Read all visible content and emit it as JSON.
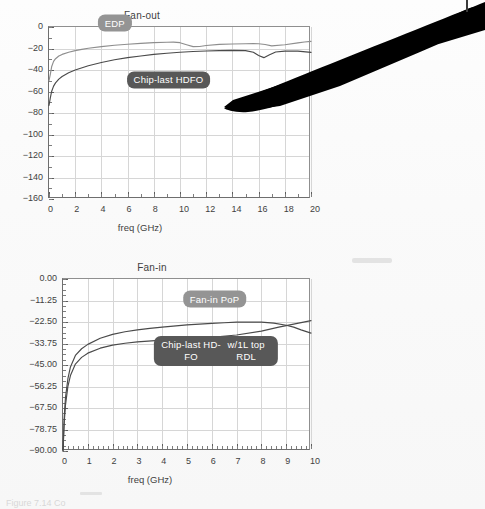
{
  "document": {
    "kind": "scanned-figure-page",
    "caption_partial": "Figure 7.14  Co",
    "background_color": "#fafafa"
  },
  "colors": {
    "axis": "#6e6e6e",
    "grid": "#d6d6d6",
    "text": "#3f3f3f",
    "curve_light": "#8e8e8e",
    "curve_dark": "#4a4a4a",
    "callout_light": "#949494",
    "callout_dark": "#585858",
    "artifact": "#000000"
  },
  "artifacts": {
    "black_wedge_name": "scan-shadow-wedge",
    "edge_mark_name": "page-edge-mark"
  },
  "chart_data": [
    {
      "type": "line",
      "name": "fan-out",
      "title": "Fan-out",
      "xlabel": "freq (GHz)",
      "ylabel": "",
      "xlim": [
        0,
        20
      ],
      "ylim": [
        -160,
        0
      ],
      "xticks": [
        0,
        2,
        4,
        6,
        8,
        10,
        12,
        14,
        16,
        18,
        20
      ],
      "xtick_labels": [
        "0",
        "2",
        "4",
        "6",
        "8",
        "10",
        "12",
        "14",
        "16",
        "18",
        "20"
      ],
      "x_minor_step": 1,
      "yticks": [
        0,
        -20,
        -40,
        -60,
        -80,
        -100,
        -120,
        -140,
        -160
      ],
      "ytick_labels": [
        "0",
        "-20",
        "-40",
        "-60",
        "-80",
        "-100",
        "-120",
        "-140",
        "-160"
      ],
      "y_minor_step": 10,
      "grid": true,
      "legend_position": "inline-callouts",
      "series": [
        {
          "name": "EDP",
          "color": "#8e8e8e",
          "x": [
            0,
            0.1,
            0.2,
            0.35,
            0.5,
            0.75,
            1,
            1.5,
            2,
            2.5,
            3,
            4,
            5,
            6,
            7,
            8,
            9,
            9.5,
            10,
            10.5,
            11,
            11.5,
            12,
            13,
            14,
            15,
            15.6,
            16,
            16.5,
            17,
            18,
            19,
            19.5,
            20
          ],
          "y": [
            -50,
            -44,
            -37,
            -32,
            -29.5,
            -27,
            -25.5,
            -23.5,
            -22,
            -20.8,
            -19.8,
            -18.2,
            -17,
            -16,
            -15.2,
            -14.6,
            -14.2,
            -14.1,
            -14.6,
            -16.5,
            -18.3,
            -18.1,
            -17.2,
            -16.2,
            -15.8,
            -15.6,
            -15.5,
            -15.6,
            -16.3,
            -17.6,
            -16.5,
            -14.8,
            -14.0,
            -13.4
          ]
        },
        {
          "name": "Chip-last HDFO",
          "color": "#4a4a4a",
          "x": [
            0,
            0.1,
            0.2,
            0.35,
            0.5,
            0.75,
            1,
            1.5,
            2,
            3,
            4,
            5,
            6,
            7,
            8,
            9,
            10,
            11,
            12,
            13,
            14,
            15,
            15.6,
            16,
            16.4,
            16.8,
            17.3,
            18,
            19,
            20
          ],
          "y": [
            -73,
            -66,
            -60,
            -55,
            -52,
            -48.5,
            -46,
            -42.5,
            -40,
            -36,
            -33,
            -30.5,
            -28.5,
            -27,
            -25.5,
            -24.4,
            -23.5,
            -22.8,
            -22.3,
            -22.0,
            -21.8,
            -22.0,
            -23.5,
            -26.5,
            -28.5,
            -26.0,
            -23.3,
            -22.4,
            -22.4,
            -23.6
          ]
        }
      ],
      "annotations": [
        {
          "text": "EDP",
          "style": "light",
          "x_data": 5.1,
          "y_data": 2.5
        },
        {
          "text": "Chip-last HDFO",
          "style": "dark",
          "x_data": 9.2,
          "y_data": -50
        }
      ]
    },
    {
      "type": "line",
      "name": "fan-in",
      "title": "Fan-in",
      "xlabel": "freq (GHz)",
      "ylabel": "",
      "xlim": [
        0,
        10
      ],
      "ylim": [
        -90,
        0
      ],
      "xticks": [
        0,
        1,
        2,
        3,
        4,
        5,
        6,
        7,
        8,
        9,
        10
      ],
      "xtick_labels": [
        "0",
        "1",
        "2",
        "3",
        "4",
        "5",
        "6",
        "7",
        "8",
        "9",
        "10"
      ],
      "x_minor_step": 0.2,
      "yticks": [
        0,
        -11.25,
        -22.5,
        -33.75,
        -45,
        -56.25,
        -67.5,
        -78.75,
        -90
      ],
      "ytick_labels": [
        "0.00",
        "-11.25",
        "-22.50",
        "-33.75",
        "-45.00",
        "-56.25",
        "-67.50",
        "-78.75",
        "-90.00"
      ],
      "y_minor_step": 2.8125,
      "grid": true,
      "legend_position": "inline-callouts",
      "series": [
        {
          "name": "Fan-in PoP",
          "color": "#4a4a4a",
          "x": [
            0,
            0.05,
            0.1,
            0.2,
            0.3,
            0.5,
            0.75,
            1,
            1.5,
            2,
            2.5,
            3,
            3.5,
            4,
            5,
            6,
            6.5,
            7,
            7.5,
            8,
            8.5,
            9,
            9.3,
            9.6,
            10
          ],
          "y": [
            -90,
            -72,
            -62,
            -52,
            -46,
            -40,
            -36.5,
            -34.2,
            -31.0,
            -29.0,
            -27.6,
            -26.6,
            -25.8,
            -25.2,
            -24.0,
            -23.2,
            -22.9,
            -22.6,
            -22.5,
            -22.6,
            -23.1,
            -24.2,
            -25.2,
            -26.6,
            -28.3
          ]
        },
        {
          "name": "Chip-last HD-FO w/1L top RDL",
          "color": "#4a4a4a",
          "x": [
            0,
            0.05,
            0.1,
            0.2,
            0.3,
            0.5,
            0.75,
            1,
            1.5,
            2,
            2.5,
            3,
            4,
            5,
            6,
            7,
            8,
            8.7,
            9,
            9.5,
            10
          ],
          "y": [
            -90,
            -75,
            -66,
            -56,
            -50.5,
            -44.5,
            -41.0,
            -38.8,
            -36.2,
            -34.6,
            -33.6,
            -32.9,
            -32.0,
            -31.3,
            -30.5,
            -29.3,
            -27.3,
            -25.2,
            -24.4,
            -23.1,
            -21.8
          ]
        }
      ],
      "annotations": [
        {
          "text": "Fan-in PoP",
          "style": "light",
          "x_data": 6.15,
          "y_data": -11.0
        },
        {
          "text": "Chip-last HD-FO",
          "style": "dark",
          "x_data": 6.2,
          "y_data": -38.0
        },
        {
          "text": "w/1L top RDL",
          "style": "dark",
          "x_data": 6.2,
          "y_data": -43.0
        }
      ]
    }
  ]
}
